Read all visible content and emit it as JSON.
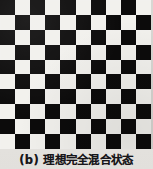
{
  "figure": {
    "caption": "(b) 理想完全混合状态",
    "caption_label": "(b)",
    "caption_body": "理想完全混合状态",
    "background_color": "#e9e7e3"
  },
  "board": {
    "name": "checkerboard",
    "rows": 10,
    "columns": 10,
    "start_color": "dark",
    "dark_color": "#0c0b0b",
    "light_color": "#f2f1ed",
    "cells": [
      [
        "dark",
        "light",
        "dark",
        "light",
        "dark",
        "light",
        "dark",
        "light",
        "dark",
        "light"
      ],
      [
        "light",
        "dark",
        "light",
        "dark",
        "light",
        "dark",
        "light",
        "dark",
        "light",
        "dark"
      ],
      [
        "dark",
        "light",
        "dark",
        "light",
        "dark",
        "light",
        "dark",
        "light",
        "dark",
        "light"
      ],
      [
        "light",
        "dark",
        "light",
        "dark",
        "light",
        "dark",
        "light",
        "dark",
        "light",
        "dark"
      ],
      [
        "dark",
        "light",
        "dark",
        "light",
        "dark",
        "light",
        "dark",
        "light",
        "dark",
        "light"
      ],
      [
        "light",
        "dark",
        "light",
        "dark",
        "light",
        "dark",
        "light",
        "dark",
        "light",
        "dark"
      ],
      [
        "dark",
        "light",
        "dark",
        "light",
        "dark",
        "light",
        "dark",
        "light",
        "dark",
        "light"
      ],
      [
        "light",
        "dark",
        "light",
        "dark",
        "light",
        "dark",
        "light",
        "dark",
        "light",
        "dark"
      ],
      [
        "dark",
        "light",
        "dark",
        "light",
        "dark",
        "light",
        "dark",
        "light",
        "dark",
        "light"
      ],
      [
        "light",
        "dark",
        "light",
        "dark",
        "light",
        "dark",
        "light",
        "dark",
        "light",
        "dark"
      ]
    ]
  }
}
